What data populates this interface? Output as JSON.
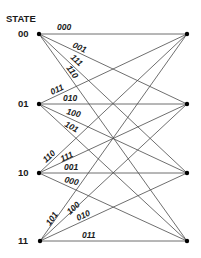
{
  "diagram": {
    "title": "STATE",
    "type": "trellis",
    "line_color": "#4a4a4a",
    "node_color": "#000000",
    "states": [
      {
        "label": "00",
        "y": 34
      },
      {
        "label": "01",
        "y": 104
      },
      {
        "label": "10",
        "y": 173
      },
      {
        "label": "11",
        "y": 241
      }
    ],
    "left_x": 39,
    "right_x": 187,
    "edges": [
      {
        "from": "00",
        "to": "00",
        "label": "000"
      },
      {
        "from": "00",
        "to": "01",
        "label": "001"
      },
      {
        "from": "00",
        "to": "10",
        "label": "111"
      },
      {
        "from": "00",
        "to": "11",
        "label": "110"
      },
      {
        "from": "01",
        "to": "00",
        "label": "011"
      },
      {
        "from": "01",
        "to": "01",
        "label": "010"
      },
      {
        "from": "01",
        "to": "10",
        "label": "100"
      },
      {
        "from": "01",
        "to": "11",
        "label": "101"
      },
      {
        "from": "10",
        "to": "00",
        "label": "110"
      },
      {
        "from": "10",
        "to": "01",
        "label": "111"
      },
      {
        "from": "10",
        "to": "10",
        "label": "001"
      },
      {
        "from": "10",
        "to": "11",
        "label": "000"
      },
      {
        "from": "11",
        "to": "00",
        "label": "101"
      },
      {
        "from": "11",
        "to": "01",
        "label": "100"
      },
      {
        "from": "11",
        "to": "10",
        "label": "010"
      },
      {
        "from": "11",
        "to": "11",
        "label": "011"
      }
    ]
  }
}
